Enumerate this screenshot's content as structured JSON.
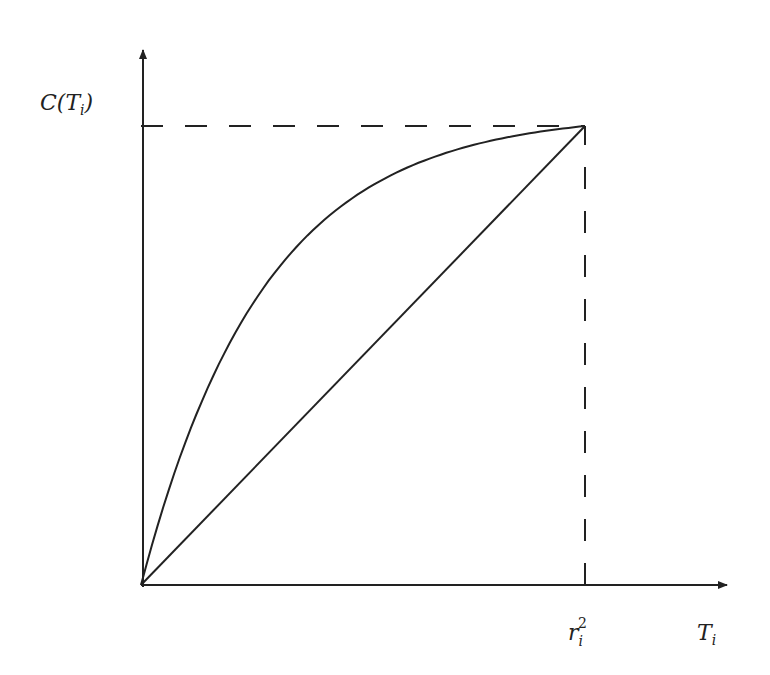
{
  "chart_data": {
    "type": "line",
    "title": "",
    "xlabel": "T_i",
    "ylabel": "C(T_i)",
    "x_tick_label": "r_i^2",
    "xlim": [
      0,
      1
    ],
    "ylim": [
      0,
      1
    ],
    "series": [
      {
        "name": "concave curve",
        "style": "solid",
        "shape": "concave",
        "x": [
          0,
          0.1,
          0.2,
          0.3,
          0.4,
          0.5,
          0.6,
          0.7,
          0.8,
          0.9,
          1.0
        ],
        "y": [
          0,
          0.34,
          0.55,
          0.69,
          0.79,
          0.86,
          0.91,
          0.95,
          0.975,
          0.993,
          1.0
        ]
      },
      {
        "name": "diagonal",
        "style": "solid",
        "x": [
          0,
          1
        ],
        "y": [
          0,
          1
        ]
      }
    ],
    "guides": [
      {
        "name": "horizontal-dashed",
        "from": [
          0,
          1
        ],
        "to": [
          1,
          1
        ]
      },
      {
        "name": "vertical-dashed",
        "from": [
          1,
          0
        ],
        "to": [
          1,
          1
        ]
      }
    ]
  },
  "labels": {
    "y_axis": {
      "main": "C(T",
      "sub": "i",
      "close": ")"
    },
    "x_axis": {
      "main": "T",
      "sub": "i"
    },
    "x_tick": {
      "main": "r",
      "sub": "i",
      "sup": "2"
    }
  }
}
